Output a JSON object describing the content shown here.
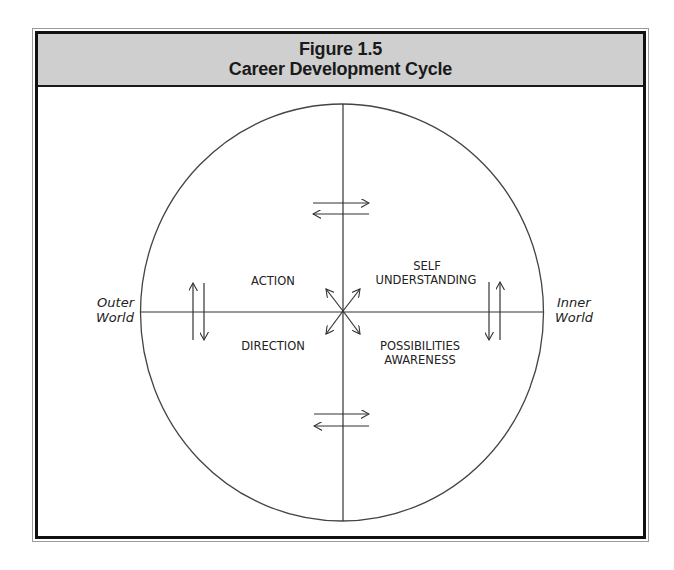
{
  "figure": {
    "number": "Figure 1.5",
    "title": "Career Development Cycle"
  },
  "axes": {
    "left_label_line1": "Outer",
    "left_label_line2": "World",
    "right_label_line1": "Inner",
    "right_label_line2": "World"
  },
  "quadrants": {
    "top_left": "ACTION",
    "bottom_left": "DIRECTION",
    "top_right_line1": "SELF",
    "top_right_line2": "UNDERSTANDING",
    "bottom_right_line1": "POSSIBILITIES",
    "bottom_right_line2": "AWARENESS"
  },
  "colors": {
    "header_fill": "#cfcfcf",
    "line": "#333333",
    "border": "#111111"
  }
}
